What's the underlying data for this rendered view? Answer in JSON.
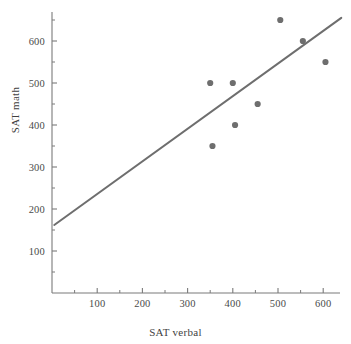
{
  "chart_data": {
    "type": "scatter",
    "title": "",
    "xlabel": "SAT verbal",
    "ylabel": "SAT math",
    "xlim": [
      0,
      640
    ],
    "ylim": [
      0,
      660
    ],
    "grid": false,
    "legend": null,
    "x_ticks": [
      100,
      200,
      300,
      400,
      500,
      600
    ],
    "x_tick_labels": [
      "100",
      "200",
      "300",
      "400",
      "500",
      "600"
    ],
    "x_minor_ticks": [
      50,
      150,
      250,
      350,
      450,
      550
    ],
    "y_ticks": [
      100,
      200,
      300,
      400,
      500,
      600
    ],
    "y_tick_labels": [
      "100",
      "200",
      "300",
      "400",
      "500",
      "600"
    ],
    "y_minor_ticks": [
      50,
      150,
      250,
      350,
      450,
      550,
      650
    ],
    "points": [
      {
        "x": 350,
        "y": 500
      },
      {
        "x": 355,
        "y": 350
      },
      {
        "x": 400,
        "y": 500
      },
      {
        "x": 405,
        "y": 400
      },
      {
        "x": 455,
        "y": 450
      },
      {
        "x": 505,
        "y": 650
      },
      {
        "x": 555,
        "y": 600
      },
      {
        "x": 605,
        "y": 550
      }
    ],
    "marker": {
      "shape": "circle",
      "color": "#6e6e6e",
      "size_px": 5
    },
    "fit_line": {
      "name": "regression line",
      "color": "#6e6e6e",
      "width_px": 2,
      "x_start": 5,
      "y_start": 162,
      "x_end": 640,
      "y_end": 655
    },
    "axis_color": "#7a7a7a",
    "text_color": "#3f3f3f"
  }
}
